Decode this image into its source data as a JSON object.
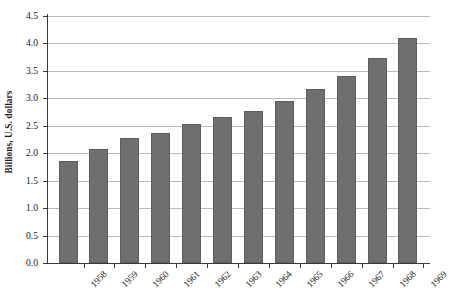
{
  "chart_data": {
    "type": "bar",
    "title": "",
    "xlabel": "",
    "ylabel": "Billions, U.S. dollars",
    "categories": [
      "1958",
      "1959",
      "1960",
      "1961",
      "1962",
      "1963",
      "1964",
      "1965",
      "1966",
      "1967",
      "1968",
      "1969"
    ],
    "values": [
      1.85,
      2.07,
      2.27,
      2.36,
      2.52,
      2.66,
      2.77,
      2.95,
      3.16,
      3.4,
      3.72,
      4.1
    ],
    "series": [
      {
        "name": "",
        "values": [
          1.85,
          2.07,
          2.27,
          2.36,
          2.52,
          2.66,
          2.77,
          2.95,
          3.16,
          3.4,
          3.72,
          4.1
        ]
      }
    ],
    "ylim": [
      0.0,
      4.5
    ],
    "ytick_labels": [
      "0.0",
      "0.5",
      "1.0",
      "1.5",
      "2.0",
      "2.5",
      "3.0",
      "3.5",
      "4.0",
      "4.5"
    ],
    "ytick_values": [
      0.0,
      0.5,
      1.0,
      1.5,
      2.0,
      2.5,
      3.0,
      3.5,
      4.0,
      4.5
    ],
    "grid": true,
    "legend": false,
    "legend_position": "none",
    "bar_color": "#6f6f6f",
    "gridline_color": "#b9b9b9",
    "axis_color": "#3b3b3b",
    "background_color": "#ffffff",
    "xtick_label_rotation": 45
  }
}
